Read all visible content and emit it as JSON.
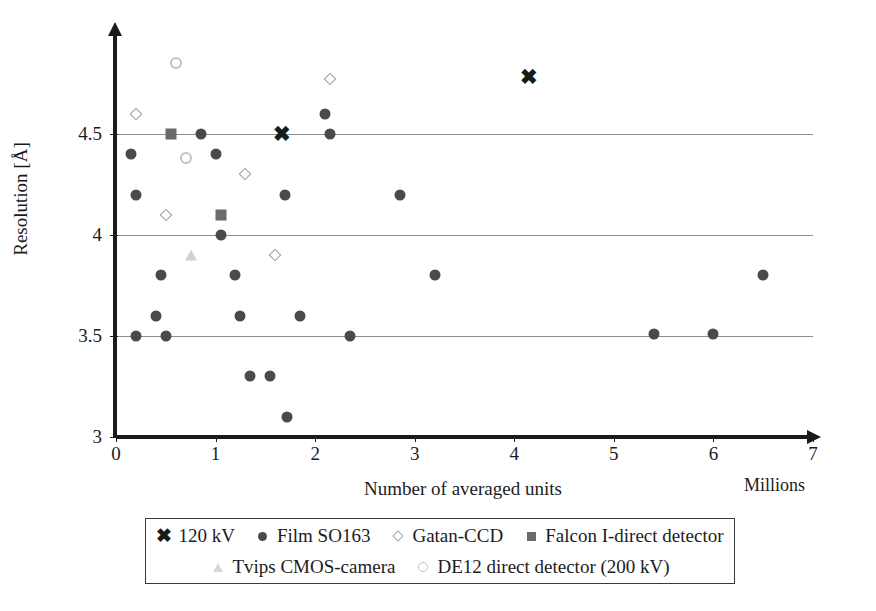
{
  "chart_data": {
    "type": "scatter",
    "title": "",
    "xlabel": "Number of averaged units",
    "xunit": "Millions",
    "ylabel": "Resolution [Å]",
    "xlim": [
      0,
      7
    ],
    "ylim": [
      3,
      5
    ],
    "xticks": [
      "0",
      "1",
      "2",
      "3",
      "4",
      "5",
      "6",
      "7"
    ],
    "xtick_values": [
      0,
      1,
      2,
      3,
      4,
      5,
      6,
      7
    ],
    "yticks": [
      "3",
      "3.5",
      "4",
      "4.5"
    ],
    "ytick_values": [
      3,
      3.5,
      4,
      4.5
    ],
    "gridlines": [
      3.5,
      4,
      4.5
    ],
    "grid": "horizontal-only",
    "legend_position": "below-plot",
    "series": [
      {
        "name": "120 kV",
        "marker": "x-bold",
        "color": "#1a1a1a",
        "points": [
          [
            1.67,
            4.5
          ],
          [
            4.15,
            4.78
          ]
        ]
      },
      {
        "name": "Film SO163",
        "marker": "circle-filled",
        "color": "#4a4a4a",
        "points": [
          [
            0.15,
            4.4
          ],
          [
            0.2,
            4.2
          ],
          [
            0.85,
            4.5
          ],
          [
            1.0,
            4.4
          ],
          [
            1.05,
            4.0
          ],
          [
            2.1,
            4.6
          ],
          [
            2.15,
            4.5
          ],
          [
            1.7,
            4.2
          ],
          [
            2.85,
            4.2
          ],
          [
            0.45,
            3.8
          ],
          [
            1.2,
            3.8
          ],
          [
            3.2,
            3.8
          ],
          [
            6.5,
            3.8
          ],
          [
            0.4,
            3.6
          ],
          [
            1.25,
            3.6
          ],
          [
            1.85,
            3.6
          ],
          [
            0.2,
            3.5
          ],
          [
            0.5,
            3.5
          ],
          [
            2.35,
            3.5
          ],
          [
            5.4,
            3.51
          ],
          [
            6.0,
            3.51
          ],
          [
            1.35,
            3.3
          ],
          [
            1.55,
            3.3
          ],
          [
            1.72,
            3.1
          ]
        ]
      },
      {
        "name": "Gatan-CCD",
        "marker": "diamond-open",
        "color": "#9a9a9a",
        "points": [
          [
            0.2,
            4.6
          ],
          [
            2.15,
            4.77
          ],
          [
            0.5,
            4.1
          ],
          [
            1.3,
            4.3
          ],
          [
            1.6,
            3.9
          ]
        ]
      },
      {
        "name": "Falcon I-direct detector",
        "marker": "square-filled",
        "color": "#6b6b6b",
        "points": [
          [
            0.55,
            4.5
          ],
          [
            1.05,
            4.1
          ]
        ]
      },
      {
        "name": "Tvips CMOS-camera",
        "marker": "triangle-light",
        "color": "#d2d2d2",
        "points": [
          [
            0.75,
            3.9
          ]
        ]
      },
      {
        "name": "DE12 direct detector (200 kV)",
        "marker": "circle-open-light",
        "color": "#c2c2c2",
        "points": [
          [
            0.6,
            4.85
          ],
          [
            0.7,
            4.38
          ]
        ]
      }
    ]
  },
  "legend": {
    "rows": [
      [
        {
          "label": "120 kV",
          "marker": "x-bold"
        },
        {
          "label": "Film SO163",
          "marker": "circle-filled"
        },
        {
          "label": "Gatan-CCD",
          "marker": "diamond-open"
        },
        {
          "label": "Falcon I-direct detector",
          "marker": "square-filled"
        }
      ],
      [
        {
          "label": "Tvips CMOS-camera",
          "marker": "triangle-light"
        },
        {
          "label": "DE12 direct detector (200 kV)",
          "marker": "circle-open-light"
        }
      ]
    ]
  },
  "marker_glyphs": {
    "x-bold": "✖"
  }
}
